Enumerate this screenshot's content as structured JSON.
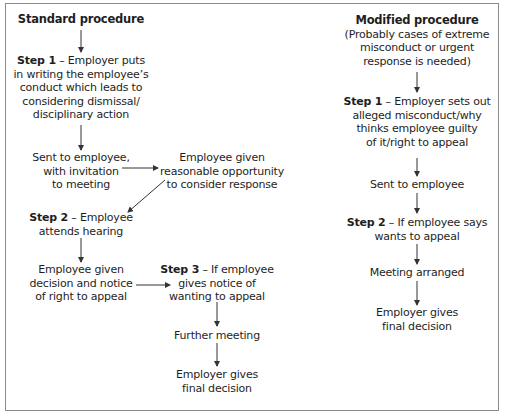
{
  "standard": {
    "title": "Standard procedure",
    "step1": {
      "label": "Step 1",
      "text_lines": [
        "– Employer puts",
        "in writing the employee’s",
        "conduct which leads to",
        "considering dismissal/",
        "disciplinary action"
      ]
    },
    "sent": [
      "Sent to employee,",
      "with invitation",
      "to meeting"
    ],
    "opportunity": [
      "Employee given",
      "reasonable opportunity",
      "to consider response"
    ],
    "step2": {
      "label": "Step 2",
      "text_lines": [
        "– Employee",
        "attends hearing"
      ]
    },
    "decision": [
      "Employee given",
      "decision and notice",
      "of right to appeal"
    ],
    "step3": {
      "label": "Step 3",
      "text_lines": [
        "– If employee",
        "gives notice of",
        "wanting to appeal"
      ]
    },
    "further": [
      "Further meeting"
    ],
    "final": [
      "Employer gives",
      "final decision"
    ]
  },
  "modified": {
    "title": "Modified procedure",
    "subtitle": [
      "(Probably cases of extreme",
      "misconduct or urgent",
      "response is needed)"
    ],
    "step1": {
      "label": "Step 1",
      "text_lines": [
        "– Employer sets out",
        "alleged misconduct/why",
        "thinks employee guilty",
        "of it/right to appeal"
      ]
    },
    "sent": [
      "Sent to employee"
    ],
    "step2": {
      "label": "Step 2",
      "text_lines": [
        "– If employee says",
        "wants to appeal"
      ]
    },
    "meeting": [
      "Meeting arranged"
    ],
    "final": [
      "Employer gives",
      "final decision"
    ]
  }
}
